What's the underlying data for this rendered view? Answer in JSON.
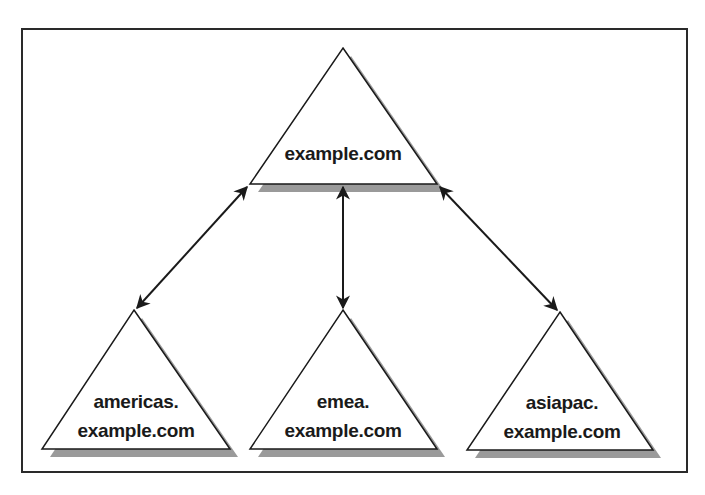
{
  "diagram": {
    "type": "domain-tree",
    "colors": {
      "frame": "#2a2a2a",
      "triangle_stroke": "#1a1a1a",
      "triangle_fill": "#ffffff",
      "shadow": "#9a9a9a",
      "arrow": "#1a1a1a",
      "text": "#1a1a1a"
    },
    "root": {
      "label": "example.com"
    },
    "children": [
      {
        "line1": "americas.",
        "line2": "example.com"
      },
      {
        "line1": "emea.",
        "line2": "example.com"
      },
      {
        "line1": "asiapac.",
        "line2": "example.com"
      }
    ],
    "connections": [
      {
        "from": "example.com",
        "to": "americas.example.com",
        "style": "bidirectional-arrow"
      },
      {
        "from": "example.com",
        "to": "emea.example.com",
        "style": "bidirectional-arrow"
      },
      {
        "from": "example.com",
        "to": "asiapac.example.com",
        "style": "bidirectional-arrow"
      }
    ]
  }
}
